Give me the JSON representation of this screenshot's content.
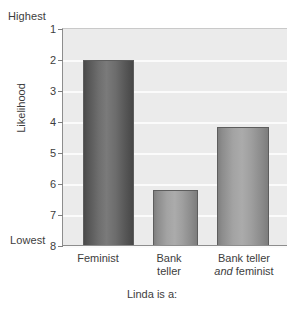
{
  "chart_data": {
    "type": "bar",
    "title": "",
    "xlabel": "Linda is a:",
    "ylabel": "Likelihood",
    "categories": [
      "Feminist",
      "Bank teller",
      "Bank teller and feminist"
    ],
    "values": [
      2.0,
      6.2,
      4.15
    ],
    "ylim": [
      1,
      8
    ],
    "y_inverted": true,
    "yticks": [
      "1",
      "2",
      "3",
      "4",
      "5",
      "6",
      "7",
      "8"
    ],
    "y_axis_top_note": "Highest",
    "y_axis_bottom_note": "Lowest",
    "grid": true,
    "legend": false,
    "bar_colors": [
      "#6e6e6e",
      "#a3a3a3",
      "#a3a3a3"
    ],
    "plot_background": "#ebebeb",
    "gridline_color": "#fbfbfb",
    "axis_color": "#8d8d8d"
  },
  "axes": {
    "y_title": "Likelihood",
    "y_highest": "Highest",
    "y_lowest": "Lowest",
    "x_title": "Linda is a:",
    "y_tick_labels": [
      "1",
      "2",
      "3",
      "4",
      "5",
      "6",
      "7",
      "8"
    ]
  },
  "x_categories": [
    {
      "line1": "Feminist",
      "line2": "",
      "line2_italic_word": ""
    },
    {
      "line1": "Bank",
      "line2": "teller",
      "line2_italic_word": ""
    },
    {
      "line1": "Bank teller",
      "line2": "feminist",
      "line2_italic_word": "and"
    }
  ]
}
